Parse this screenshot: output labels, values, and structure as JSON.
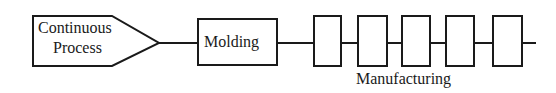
{
  "diagram": {
    "start_node": {
      "line1": "Continuous",
      "line2": "Process"
    },
    "molding_node": {
      "label": "Molding"
    },
    "manufacturing": {
      "label": "Manufacturing",
      "station_count": 5
    },
    "colors": {
      "stroke": "#1a1a1a",
      "background": "#ffffff"
    }
  }
}
